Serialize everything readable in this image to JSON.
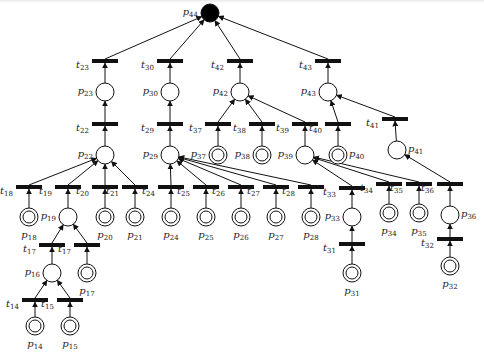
{
  "diagram": {
    "type": "petri-net",
    "root_place": {
      "id": "p44",
      "label": "p",
      "sub": "44",
      "x": 210,
      "y": 13,
      "r": 9,
      "marked": true
    },
    "places": [
      {
        "id": "p23",
        "sub": "23",
        "x": 105,
        "y": 92,
        "kind": "normal",
        "label_pos": "left"
      },
      {
        "id": "p30",
        "sub": "30",
        "x": 170,
        "y": 92,
        "kind": "normal",
        "label_pos": "left"
      },
      {
        "id": "p42",
        "sub": "42",
        "x": 240,
        "y": 92,
        "kind": "normal",
        "label_pos": "left"
      },
      {
        "id": "p43",
        "sub": "43",
        "x": 328,
        "y": 92,
        "kind": "normal",
        "label_pos": "left"
      },
      {
        "id": "p22",
        "sub": "22",
        "x": 105,
        "y": 155,
        "kind": "normal",
        "label_pos": "left"
      },
      {
        "id": "p29",
        "sub": "29",
        "x": 170,
        "y": 155,
        "kind": "normal",
        "label_pos": "left"
      },
      {
        "id": "p37",
        "sub": "37",
        "x": 218,
        "y": 155,
        "kind": "source",
        "label_pos": "left"
      },
      {
        "id": "p38",
        "sub": "38",
        "x": 262,
        "y": 155,
        "kind": "source",
        "label_pos": "left"
      },
      {
        "id": "p39",
        "sub": "39",
        "x": 305,
        "y": 155,
        "kind": "normal",
        "label_pos": "left"
      },
      {
        "id": "p40",
        "sub": "40",
        "x": 338,
        "y": 155,
        "kind": "source",
        "label_pos": "right"
      },
      {
        "id": "p41",
        "sub": "41",
        "x": 397,
        "y": 150,
        "kind": "normal",
        "label_pos": "right"
      },
      {
        "id": "p18",
        "sub": "18",
        "x": 29,
        "y": 217,
        "kind": "source",
        "label_pos": "below"
      },
      {
        "id": "p19",
        "sub": "19",
        "x": 68,
        "y": 217,
        "kind": "normal",
        "label_pos": "left"
      },
      {
        "id": "p20",
        "sub": "20",
        "x": 105,
        "y": 217,
        "kind": "source",
        "label_pos": "below"
      },
      {
        "id": "p21",
        "sub": "21",
        "x": 135,
        "y": 217,
        "kind": "source",
        "label_pos": "below"
      },
      {
        "id": "p24",
        "sub": "24",
        "x": 171,
        "y": 217,
        "kind": "source",
        "label_pos": "below"
      },
      {
        "id": "p25",
        "sub": "25",
        "x": 206,
        "y": 217,
        "kind": "source",
        "label_pos": "below"
      },
      {
        "id": "p26",
        "sub": "26",
        "x": 241,
        "y": 217,
        "kind": "source",
        "label_pos": "below"
      },
      {
        "id": "p27",
        "sub": "27",
        "x": 276,
        "y": 217,
        "kind": "source",
        "label_pos": "below"
      },
      {
        "id": "p28",
        "sub": "28",
        "x": 311,
        "y": 217,
        "kind": "source",
        "label_pos": "below"
      },
      {
        "id": "p33",
        "sub": "33",
        "x": 352,
        "y": 217,
        "kind": "normal",
        "label_pos": "left"
      },
      {
        "id": "p34",
        "sub": "34",
        "x": 389,
        "y": 213,
        "kind": "source",
        "label_pos": "below"
      },
      {
        "id": "p35",
        "sub": "35",
        "x": 419,
        "y": 213,
        "kind": "source",
        "label_pos": "below"
      },
      {
        "id": "p36",
        "sub": "36",
        "x": 450,
        "y": 215,
        "kind": "normal",
        "label_pos": "right"
      },
      {
        "id": "p16",
        "sub": "16",
        "x": 52,
        "y": 273,
        "kind": "normal",
        "label_pos": "left"
      },
      {
        "id": "p17",
        "sub": "17",
        "x": 87,
        "y": 273,
        "kind": "source",
        "label_pos": "below"
      },
      {
        "id": "p14",
        "sub": "14",
        "x": 35,
        "y": 326,
        "kind": "source",
        "label_pos": "below"
      },
      {
        "id": "p15",
        "sub": "15",
        "x": 70,
        "y": 326,
        "kind": "source",
        "label_pos": "below"
      },
      {
        "id": "p31",
        "sub": "31",
        "x": 352,
        "y": 273,
        "kind": "source",
        "label_pos": "below"
      },
      {
        "id": "p32",
        "sub": "32",
        "x": 450,
        "y": 266,
        "kind": "source",
        "label_pos": "below"
      }
    ],
    "transitions": [
      {
        "id": "t23",
        "sub": "23",
        "x": 105,
        "y": 61,
        "to": "p44"
      },
      {
        "id": "t30",
        "sub": "30",
        "x": 170,
        "y": 61,
        "to": "p44"
      },
      {
        "id": "t42",
        "sub": "42",
        "x": 240,
        "y": 61,
        "to": "p44"
      },
      {
        "id": "t43",
        "sub": "43",
        "x": 328,
        "y": 61,
        "to": "p44"
      },
      {
        "id": "t22",
        "sub": "22",
        "x": 105,
        "y": 124,
        "to": "p23"
      },
      {
        "id": "t29",
        "sub": "29",
        "x": 170,
        "y": 124,
        "to": "p30"
      },
      {
        "id": "t37",
        "sub": "37",
        "x": 218,
        "y": 124,
        "to": "p42"
      },
      {
        "id": "t38",
        "sub": "38",
        "x": 262,
        "y": 124,
        "to": "p42"
      },
      {
        "id": "t39",
        "sub": "39",
        "x": 305,
        "y": 124,
        "to": "p42"
      },
      {
        "id": "t40",
        "sub": "40",
        "x": 338,
        "y": 124,
        "to": "p43"
      },
      {
        "id": "t41",
        "sub": "41",
        "x": 395,
        "y": 119,
        "to": "p43"
      },
      {
        "id": "t18",
        "sub": "18",
        "x": 29,
        "y": 187,
        "to": "p22"
      },
      {
        "id": "t19",
        "sub": "19",
        "x": 68,
        "y": 187,
        "to": "p22"
      },
      {
        "id": "t20",
        "sub": "20",
        "x": 105,
        "y": 187,
        "to": "p22"
      },
      {
        "id": "t21",
        "sub": "21",
        "x": 135,
        "y": 187,
        "to": "p22"
      },
      {
        "id": "t24",
        "sub": "24",
        "x": 171,
        "y": 187,
        "to": "p29"
      },
      {
        "id": "t25",
        "sub": "25",
        "x": 206,
        "y": 187,
        "to": "p29"
      },
      {
        "id": "t26",
        "sub": "26",
        "x": 241,
        "y": 187,
        "to": "p29"
      },
      {
        "id": "t27",
        "sub": "27",
        "x": 276,
        "y": 187,
        "to": "p29"
      },
      {
        "id": "t28",
        "sub": "28",
        "x": 311,
        "y": 187,
        "to": "p29"
      },
      {
        "id": "t33",
        "sub": "33",
        "x": 352,
        "y": 188,
        "to": "p39"
      },
      {
        "id": "t34",
        "sub": "34",
        "x": 389,
        "y": 184,
        "to": "p39"
      },
      {
        "id": "t35",
        "sub": "35",
        "x": 419,
        "y": 184,
        "to": "p39"
      },
      {
        "id": "t36",
        "sub": "36",
        "x": 450,
        "y": 184,
        "to": "p41"
      },
      {
        "id": "t17a",
        "sub": "17",
        "x": 52,
        "y": 245,
        "to": "p19"
      },
      {
        "id": "t17b",
        "sub": "17",
        "x": 87,
        "y": 245,
        "to": "p19"
      },
      {
        "id": "t14",
        "sub": "14",
        "x": 35,
        "y": 300,
        "to": "p16"
      },
      {
        "id": "t15",
        "sub": "15",
        "x": 70,
        "y": 300,
        "to": "p16"
      },
      {
        "id": "t31",
        "sub": "31",
        "x": 352,
        "y": 244,
        "to": "p33"
      },
      {
        "id": "t32",
        "sub": "32",
        "x": 450,
        "y": 239,
        "to": "p36"
      }
    ],
    "input_arcs": [
      [
        "p23",
        "t23"
      ],
      [
        "p30",
        "t30"
      ],
      [
        "p42",
        "t42"
      ],
      [
        "p43",
        "t43"
      ],
      [
        "p22",
        "t22"
      ],
      [
        "p29",
        "t29"
      ],
      [
        "p37",
        "t37"
      ],
      [
        "p38",
        "t38"
      ],
      [
        "p39",
        "t39"
      ],
      [
        "p40",
        "t40"
      ],
      [
        "p41",
        "t41"
      ],
      [
        "p18",
        "t18"
      ],
      [
        "p19",
        "t19"
      ],
      [
        "p20",
        "t20"
      ],
      [
        "p21",
        "t21"
      ],
      [
        "p24",
        "t24"
      ],
      [
        "p25",
        "t25"
      ],
      [
        "p26",
        "t26"
      ],
      [
        "p27",
        "t27"
      ],
      [
        "p28",
        "t28"
      ],
      [
        "p33",
        "t33"
      ],
      [
        "p34",
        "t34"
      ],
      [
        "p35",
        "t35"
      ],
      [
        "p36",
        "t36"
      ],
      [
        "p16",
        "t17a"
      ],
      [
        "p17",
        "t17b"
      ],
      [
        "p14",
        "t14"
      ],
      [
        "p15",
        "t15"
      ],
      [
        "p31",
        "t31"
      ],
      [
        "p32",
        "t32"
      ]
    ],
    "colors": {
      "stroke": "#111111",
      "background": "#ffffff",
      "marked_token": "#000000"
    }
  }
}
